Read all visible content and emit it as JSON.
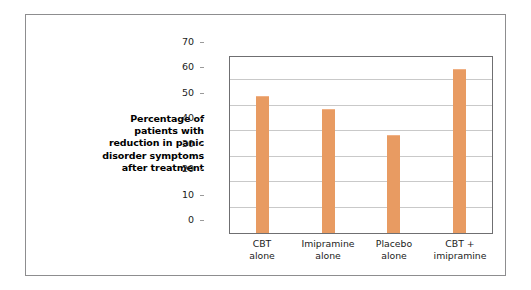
{
  "chart_data": {
    "type": "bar",
    "title": "",
    "xlabel": "",
    "ylabel": "Percentage of patients with reduction in panic disorder symptoms after treatment",
    "ylabel_lines": [
      "Percentage of",
      "patients with",
      "reduction in panic",
      "disorder symptoms",
      "after treatment"
    ],
    "categories": [
      "CBT alone",
      "Imipramine alone",
      "Placebo alone",
      "CBT + imipramine"
    ],
    "category_lines": [
      [
        "CBT",
        "alone"
      ],
      [
        "Imipramine",
        "alone"
      ],
      [
        "Placebo",
        "alone"
      ],
      [
        "CBT +",
        "imipramine"
      ]
    ],
    "values": [
      53.5,
      48.5,
      38,
      64
    ],
    "ylim": [
      0,
      70
    ],
    "ytick_values": [
      70,
      60,
      50,
      40,
      30,
      20,
      10,
      0
    ],
    "ytick_labels": [
      "70",
      "60",
      "50",
      "40",
      "30",
      "20",
      "10",
      "0"
    ],
    "grid": true,
    "legend": false,
    "bar_color": "#e89b62",
    "grid_color": "#c9c9c9",
    "axis_color": "#6f6f71",
    "frame_color": "#8d8d8f",
    "background_color": "#ffffff"
  }
}
